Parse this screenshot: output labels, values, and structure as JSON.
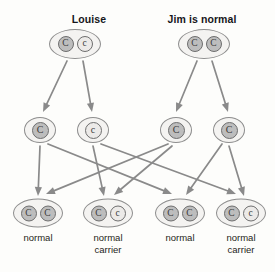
{
  "diagram": {
    "type": "punnett-inheritance-pedigree",
    "background_color": "#fdfdfb",
    "arrow_color": "#8a8a8a",
    "dominant_allele_color": "#bdbdbd",
    "recessive_allele_color": "#eceae8",
    "cell_outline_color": "#8d8d8d"
  },
  "parents": [
    {
      "title": "Louise",
      "title_x": 89,
      "title_y": 13,
      "cell_x": 75,
      "cell_y": 44,
      "alleles": [
        {
          "symbol": "C",
          "type": "dominant"
        },
        {
          "symbol": "c",
          "type": "recessive"
        }
      ]
    },
    {
      "title": "Jim is normal",
      "title_x": 202,
      "title_y": 13,
      "cell_x": 204,
      "cell_y": 44,
      "alleles": [
        {
          "symbol": "C",
          "type": "dominant"
        },
        {
          "symbol": "C",
          "type": "dominant"
        }
      ]
    }
  ],
  "gametes": [
    {
      "symbol": "C",
      "type": "dominant",
      "x": 40,
      "y": 130
    },
    {
      "symbol": "c",
      "type": "recessive",
      "x": 93,
      "y": 130
    },
    {
      "symbol": "C",
      "type": "dominant",
      "x": 176,
      "y": 130
    },
    {
      "symbol": "C",
      "type": "dominant",
      "x": 229,
      "y": 130
    }
  ],
  "offspring": [
    {
      "x": 38,
      "y": 213,
      "label": "normal",
      "label_lines": [
        "normal"
      ],
      "label_x": 38,
      "label_y": 232,
      "alleles": [
        {
          "symbol": "C",
          "type": "dominant"
        },
        {
          "symbol": "C",
          "type": "dominant"
        }
      ]
    },
    {
      "x": 108,
      "y": 213,
      "label": "normal carrier",
      "label_lines": [
        "normal",
        "carrier"
      ],
      "label_x": 108,
      "label_y": 232,
      "alleles": [
        {
          "symbol": "C",
          "type": "dominant"
        },
        {
          "symbol": "c",
          "type": "recessive"
        }
      ]
    },
    {
      "x": 180,
      "y": 213,
      "label": "normal",
      "label_lines": [
        "normal"
      ],
      "label_x": 180,
      "label_y": 232,
      "alleles": [
        {
          "symbol": "C",
          "type": "dominant"
        },
        {
          "symbol": "C",
          "type": "dominant"
        }
      ]
    },
    {
      "x": 241,
      "y": 213,
      "label": "normal carrier",
      "label_lines": [
        "normal",
        "carrier"
      ],
      "label_x": 241,
      "label_y": 232,
      "alleles": [
        {
          "symbol": "C",
          "type": "dominant"
        },
        {
          "symbol": "c",
          "type": "recessive"
        }
      ]
    }
  ],
  "arrows": [
    {
      "name": "louise-to-gamete-1",
      "x1": 67,
      "y1": 61,
      "x2": 43,
      "y2": 112
    },
    {
      "name": "louise-to-gamete-2",
      "x1": 83,
      "y1": 61,
      "x2": 92,
      "y2": 112
    },
    {
      "name": "jim-to-gamete-3",
      "x1": 197,
      "y1": 61,
      "x2": 176,
      "y2": 112
    },
    {
      "name": "jim-to-gamete-4",
      "x1": 212,
      "y1": 61,
      "x2": 228,
      "y2": 112
    },
    {
      "name": "gamete-1-to-offspring-1",
      "x1": 40,
      "y1": 146,
      "x2": 38,
      "y2": 196
    },
    {
      "name": "gamete-1-to-offspring-3",
      "x1": 48,
      "y1": 144,
      "x2": 172,
      "y2": 194
    },
    {
      "name": "gamete-2-to-offspring-2",
      "x1": 93,
      "y1": 146,
      "x2": 104,
      "y2": 196
    },
    {
      "name": "gamete-2-to-offspring-4",
      "x1": 101,
      "y1": 144,
      "x2": 236,
      "y2": 194
    },
    {
      "name": "gamete-3-to-offspring-1",
      "x1": 168,
      "y1": 144,
      "x2": 46,
      "y2": 194
    },
    {
      "name": "gamete-3-to-offspring-2",
      "x1": 172,
      "y1": 146,
      "x2": 114,
      "y2": 195
    },
    {
      "name": "gamete-4-to-offspring-3",
      "x1": 222,
      "y1": 144,
      "x2": 186,
      "y2": 195
    },
    {
      "name": "gamete-4-to-offspring-4",
      "x1": 229,
      "y1": 146,
      "x2": 244,
      "y2": 196
    }
  ]
}
